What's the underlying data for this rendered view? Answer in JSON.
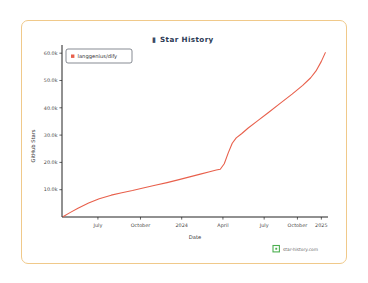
{
  "card": {
    "border_color": "#f0c98a",
    "background": "#ffffff"
  },
  "title": {
    "icon": "star-icon",
    "text": "Star History",
    "color": "#2b3a55"
  },
  "legend": {
    "position": "top-left",
    "entries": [
      {
        "label": "langgenius/dify",
        "color": "#e8604c",
        "marker": "square"
      }
    ]
  },
  "watermark": {
    "icon": "star-history-logo-icon",
    "text": "star-history.com",
    "icon_color": "#4caf50"
  },
  "chart_data": {
    "type": "line",
    "title": "Star History",
    "xlabel": "Date",
    "ylabel": "GitHub Stars",
    "grid": false,
    "legend_position": "top-left",
    "ylim": [
      0,
      63000
    ],
    "ytick_labels": [
      "10.0k",
      "20.0k",
      "30.0k",
      "40.0k",
      "50.0k",
      "60.0k"
    ],
    "ytick_values": [
      10000,
      20000,
      30000,
      40000,
      50000,
      60000
    ],
    "xtick_labels": [
      "July",
      "October",
      "2024",
      "April",
      "July",
      "October",
      "2025"
    ],
    "xtick_positions": [
      0.135,
      0.295,
      0.45,
      0.605,
      0.76,
      0.885,
      0.975
    ],
    "series": [
      {
        "name": "langgenius/dify",
        "color": "#e8604c",
        "points": [
          {
            "x": 0.005,
            "y": 150
          },
          {
            "x": 0.03,
            "y": 1600
          },
          {
            "x": 0.06,
            "y": 3200
          },
          {
            "x": 0.1,
            "y": 5100
          },
          {
            "x": 0.14,
            "y": 6700
          },
          {
            "x": 0.185,
            "y": 8000
          },
          {
            "x": 0.225,
            "y": 8900
          },
          {
            "x": 0.265,
            "y": 9700
          },
          {
            "x": 0.305,
            "y": 10600
          },
          {
            "x": 0.35,
            "y": 11600
          },
          {
            "x": 0.395,
            "y": 12600
          },
          {
            "x": 0.44,
            "y": 13700
          },
          {
            "x": 0.48,
            "y": 14700
          },
          {
            "x": 0.52,
            "y": 15700
          },
          {
            "x": 0.555,
            "y": 16600
          },
          {
            "x": 0.58,
            "y": 17200
          },
          {
            "x": 0.595,
            "y": 17500
          },
          {
            "x": 0.61,
            "y": 19500
          },
          {
            "x": 0.625,
            "y": 23500
          },
          {
            "x": 0.64,
            "y": 27000
          },
          {
            "x": 0.655,
            "y": 29000
          },
          {
            "x": 0.675,
            "y": 30500
          },
          {
            "x": 0.7,
            "y": 32600
          },
          {
            "x": 0.735,
            "y": 35200
          },
          {
            "x": 0.775,
            "y": 38200
          },
          {
            "x": 0.82,
            "y": 41600
          },
          {
            "x": 0.865,
            "y": 45000
          },
          {
            "x": 0.905,
            "y": 48200
          },
          {
            "x": 0.935,
            "y": 51000
          },
          {
            "x": 0.955,
            "y": 53500
          },
          {
            "x": 0.975,
            "y": 57000
          },
          {
            "x": 0.99,
            "y": 60200
          }
        ]
      }
    ]
  }
}
